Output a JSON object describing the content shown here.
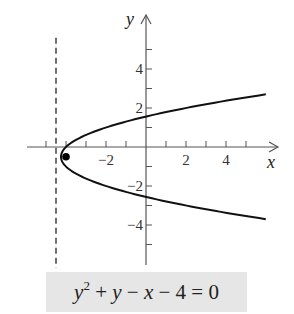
{
  "diagram": {
    "type": "parabola-graph",
    "equation": {
      "text": "y^2 + y - x - 4 = 0",
      "parts": {
        "y": "y",
        "exp": "2",
        "op1": " + ",
        "y2": "y",
        "op2": " − ",
        "x": "x",
        "op3": " − 4 = 0"
      }
    },
    "axes": {
      "x_label": "x",
      "y_label": "y",
      "x_range": [
        -6,
        6.6
      ],
      "y_range": [
        -6,
        6
      ],
      "x_ticks": [
        -5,
        -4,
        -3,
        -2,
        -1,
        1,
        2,
        3,
        4,
        5
      ],
      "y_ticks": [
        -5,
        -4,
        -3,
        -2,
        -1,
        1,
        2,
        3,
        4,
        5
      ],
      "x_tick_labels": [
        {
          "value": -2,
          "text": "−2"
        },
        {
          "value": 2,
          "text": "2"
        },
        {
          "value": 4,
          "text": "4"
        }
      ],
      "y_tick_labels": [
        {
          "value": 4,
          "text": "4"
        },
        {
          "value": 2,
          "text": "2"
        },
        {
          "value": -2,
          "text": "−2"
        },
        {
          "value": -4,
          "text": "−4"
        }
      ]
    },
    "parabola": {
      "form": "x = y^2 + y - 4",
      "vertex": [
        -4.25,
        -0.5
      ],
      "y_from": -3.7,
      "y_to": 2.7
    },
    "focus": {
      "x": -4,
      "y": -0.5
    },
    "directrix": {
      "x": -4.5,
      "y_from": -6.2,
      "y_to": 5.6
    },
    "colors": {
      "curve": "#111111",
      "axis": "#555555",
      "equation_background": "#e6e6e6"
    }
  }
}
